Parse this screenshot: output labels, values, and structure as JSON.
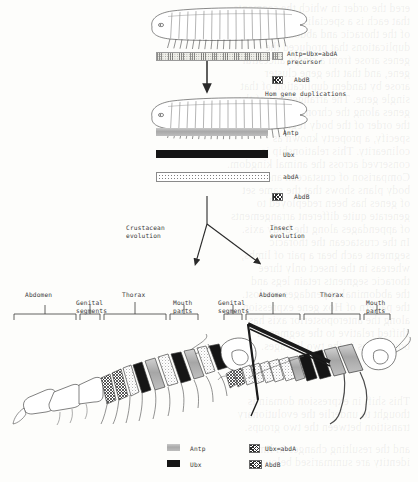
{
  "figure": {
    "type": "diagram"
  },
  "top_panel": {
    "organism_caption": "myriapod-like ancestor",
    "precursor_swatch": "precursor-hatch-swatch",
    "precursor_label_line1": "Antp=Ubx=abdA",
    "precursor_label_line2": "precursor",
    "abdb_swatch": "abdb-crosshatch-swatch",
    "abdb_label": "AbdB",
    "duplication_label": "Hom gene duplications",
    "arrow": "down-arrow"
  },
  "middle_panel": {
    "organism_caption": "post-duplication ancestor",
    "bars": [
      {
        "name": "Antp",
        "label": "Antp",
        "swatch": "antp-gray-swatch"
      },
      {
        "name": "Ubx",
        "label": "Ubx",
        "swatch": "ubx-black-swatch"
      },
      {
        "name": "abdA",
        "label": "abdA",
        "swatch": "abda-stipple-swatch"
      }
    ],
    "abdb_swatch": "abdb-crosshatch-swatch",
    "abdb_label": "AbdB"
  },
  "split": {
    "left_label_line1": "Crustacean",
    "left_label_line2": "evolution",
    "right_label_line1": "Insect",
    "right_label_line2": "evolution",
    "arrow_left": "branch-arrow-left",
    "arrow_right": "branch-arrow-right"
  },
  "left_branch": {
    "organism": "crustacean",
    "regions": [
      {
        "label_line1": "Abdomen",
        "label_line2": ""
      },
      {
        "label_line1": "Genital",
        "label_line2": "segments"
      },
      {
        "label_line1": "Thorax",
        "label_line2": ""
      },
      {
        "label_line1": "Mouth",
        "label_line2": "parts"
      }
    ]
  },
  "right_branch": {
    "organism": "insect",
    "regions": [
      {
        "label_line1": "Genital",
        "label_line2": "segments"
      },
      {
        "label_line1": "Abdomen",
        "label_line2": ""
      },
      {
        "label_line1": "Thorax",
        "label_line2": ""
      },
      {
        "label_line1": "Mouth",
        "label_line2": "parts"
      }
    ]
  },
  "legend": {
    "items": [
      {
        "label": "Antp",
        "swatch": "antp-gray-swatch"
      },
      {
        "label": "Ubx=abdA",
        "swatch": "precursor-hatch-swatch"
      },
      {
        "label": "Ubx",
        "swatch": "ubx-black-swatch"
      },
      {
        "label": "AbdB",
        "swatch": "abdb-crosshatch-swatch"
      }
    ]
  },
  "colors": {
    "page": "#fdfdfb",
    "ink": "#2a2a2a",
    "antp_gray": "#b4b4b4",
    "ubx_black": "#151515",
    "hatch_ink": "#2b2b2b",
    "ghost": "rgba(120,120,120,0.115)"
  },
  "ghost_text": {
    "lines": [
      "ered the order in which the segments",
      "that each is a specialised cluster",
      "of the thoracic and abdominal",
      "",
      "duplications that produced the",
      "genes arose from a single ancestral",
      "gene, and that the gene cluster",
      "arose by tandem duplication of that",
      "single gene. The arrangement of the",
      "genes along the chromosome reflects",
      "the order of the body regions they",
      "specify, a property known as",
      "colinearity. This relationship is",
      "conserved across the animal kingdom.",
      "",
      "Comparison of crustacean and insect",
      "body plans shows that the same set",
      "of genes has been redeployed to",
      "generate quite different arrangements",
      "of appendages along the body axis.",
      "",
      "In the crustacean the thoracic",
      "segments each bear a pair of limbs,",
      "whereas in the insect only three",
      "thoracic segments retain legs and",
      "the abdominal appendages are lost.",
      "",
      "the pattern of Hox gene expression",
      "along the anteroposterior axis has",
      "shifted relative to the segmental",
      "boundaries in the two lineages.",
      "",
      "This shift in expression domain is",
      "thought to underlie the evolutionary",
      "transition between the two groups.",
      "",
      "and the resulting changes in limb",
      "identity are summarised below."
    ]
  }
}
